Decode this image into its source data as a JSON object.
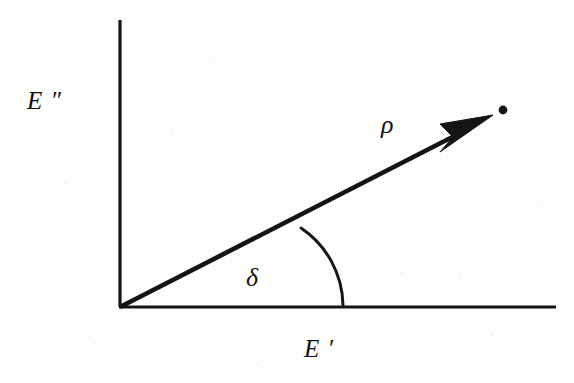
{
  "figure": {
    "background_color": "#fdfdfc",
    "ink_color": "#111111",
    "width": 574,
    "height": 383
  },
  "axes": {
    "origin": {
      "x": 120,
      "y": 307
    },
    "vertical": {
      "name": "loss-modulus-axis",
      "label": "E ″",
      "from": {
        "x": 120,
        "y": 20
      },
      "to": {
        "x": 120,
        "y": 307
      },
      "stroke_width": 3.2
    },
    "horizontal": {
      "name": "storage-modulus-axis",
      "label": "E ′",
      "from": {
        "x": 120,
        "y": 307
      },
      "to": {
        "x": 556,
        "y": 307
      },
      "stroke_width": 3.2
    }
  },
  "vector": {
    "name": "complex-modulus-vector",
    "label": "ρ",
    "from": {
      "x": 120,
      "y": 307
    },
    "tip": {
      "x": 492,
      "y": 117
    },
    "shaft_end": {
      "x": 466,
      "y": 130
    },
    "stroke_width": 4.6,
    "angle_degrees": 27,
    "arrowhead": {
      "name": "arrowhead",
      "tip": {
        "x": 493,
        "y": 116
      },
      "back_upper": {
        "x": 441,
        "y": 125
      },
      "notch": {
        "x": 452,
        "y": 137
      },
      "back_lower": {
        "x": 441,
        "y": 151
      }
    }
  },
  "endpoint_dot": {
    "name": "vector-endpoint-dot",
    "cx": 503,
    "cy": 110,
    "r": 4.4
  },
  "angle_arc": {
    "name": "phase-angle-arc",
    "label": "δ",
    "start": {
      "x": 301,
      "y": 228
    },
    "end": {
      "x": 343,
      "y": 305
    },
    "radius_x": 92,
    "radius_y": 92,
    "stroke_width": 3.0
  },
  "labels": {
    "loss_modulus": "E ″",
    "storage_modulus": "E ′",
    "magnitude": "ρ",
    "phase_angle": "δ"
  },
  "chart_data": {
    "type": "scatter",
    "title": "",
    "xlabel": "E ′",
    "ylabel": "E ″",
    "annotations": [
      {
        "text": "ρ",
        "meaning": "vector magnitude (complex modulus)"
      },
      {
        "text": "δ",
        "meaning": "phase angle between vector and E ′ axis"
      }
    ],
    "series": [
      {
        "name": "complex-modulus-vector",
        "points": [
          {
            "x": 0,
            "y": 0
          },
          {
            "x": 1.0,
            "y": 0.51
          }
        ]
      }
    ],
    "grid": false,
    "legend": false
  },
  "speckles": [
    {
      "x": 64,
      "y": 181,
      "size": 3
    },
    {
      "x": 212,
      "y": 60,
      "size": 2
    },
    {
      "x": 399,
      "y": 271,
      "size": 3
    },
    {
      "x": 459,
      "y": 274,
      "size": 2
    },
    {
      "x": 537,
      "y": 200,
      "size": 2
    },
    {
      "x": 256,
      "y": 363,
      "size": 2
    },
    {
      "x": 88,
      "y": 336,
      "size": 2
    },
    {
      "x": 171,
      "y": 133,
      "size": 2
    },
    {
      "x": 351,
      "y": 52,
      "size": 2
    },
    {
      "x": 491,
      "y": 333,
      "size": 3
    }
  ]
}
